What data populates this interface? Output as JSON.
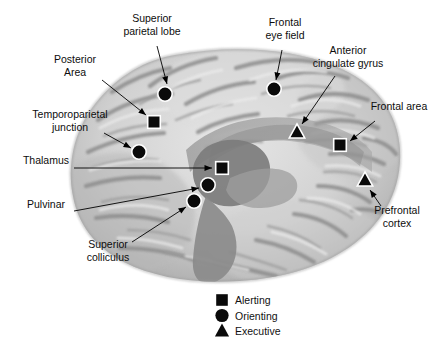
{
  "figure": {
    "background_color": "#ffffff",
    "marker_color": "#0a0a0a",
    "marker_outline_color": "#ffffff",
    "brain_fill_light": "#d9d9d9",
    "brain_fill_mid": "#b4b4b4",
    "brain_fill_dark": "#8e8e8e",
    "overlay_band_color": "#9a9a9a",
    "overlay_core_color": "#7b7b7b"
  },
  "callouts": [
    {
      "id": "superior-parietal-lobe",
      "lines": [
        "Superior",
        "parietal lobe"
      ],
      "marker": "circle",
      "network": "Orienting",
      "label_x": 152,
      "label_y": 22,
      "marker_x": 165,
      "marker_y": 94,
      "leader": "M157,46 L167,84"
    },
    {
      "id": "posterior-area",
      "lines": [
        "Posterior",
        "Area"
      ],
      "marker": "square",
      "network": "Alerting",
      "label_x": 75,
      "label_y": 63,
      "marker_x": 154,
      "marker_y": 122,
      "leader": "M102,80 L146,115"
    },
    {
      "id": "temporoparietal-junction",
      "lines": [
        "Temporoparietal",
        "junction"
      ],
      "marker": "circle",
      "network": "Orienting",
      "label_x": 70,
      "label_y": 118,
      "marker_x": 139,
      "marker_y": 152,
      "leader": "M104,133 L131,148"
    },
    {
      "id": "thalamus",
      "lines": [
        "Thalamus"
      ],
      "marker": "square",
      "network": "Alerting",
      "label_x": 46,
      "label_y": 164,
      "marker_x": 222,
      "marker_y": 168,
      "leader": "M74,168 L212,168"
    },
    {
      "id": "pulvinar",
      "lines": [
        "Pulvinar"
      ],
      "marker": "circle",
      "network": "Orienting",
      "label_x": 46,
      "label_y": 208,
      "marker_x": 208,
      "marker_y": 185,
      "leader": "M74,211 L199,188"
    },
    {
      "id": "superior-colliculus",
      "lines": [
        "Superior",
        "colliculus"
      ],
      "marker": "circle",
      "network": "Orienting",
      "label_x": 108,
      "label_y": 248,
      "marker_x": 194,
      "marker_y": 201,
      "leader": "M132,242 L186,207"
    },
    {
      "id": "frontal-eye-field",
      "lines": [
        "Frontal",
        "eye field"
      ],
      "marker": "circle",
      "network": "Orienting",
      "label_x": 285,
      "label_y": 26,
      "marker_x": 274,
      "marker_y": 89,
      "leader": "M282,50 L276,80"
    },
    {
      "id": "anterior-cingulate-gyrus",
      "lines": [
        "Anterior",
        "cingulate gyrus"
      ],
      "marker": "triangle",
      "network": "Executive",
      "label_x": 348,
      "label_y": 54,
      "marker_x": 297,
      "marker_y": 132,
      "leader": "M335,76 L302,124"
    },
    {
      "id": "frontal-area",
      "lines": [
        "Frontal area"
      ],
      "marker": "square",
      "network": "Alerting",
      "label_x": 399,
      "label_y": 110,
      "marker_x": 340,
      "marker_y": 145,
      "leader": "M375,121 L350,141"
    },
    {
      "id": "prefrontal-cortex",
      "lines": [
        "Prefrontal",
        "cortex"
      ],
      "marker": "triangle",
      "network": "Executive",
      "label_x": 397,
      "label_y": 214,
      "marker_x": 365,
      "marker_y": 180,
      "leader": "M381,206 L370,190"
    }
  ],
  "legend": {
    "x": 222,
    "y": 300,
    "items": [
      {
        "shape": "square",
        "label": "Alerting"
      },
      {
        "shape": "circle",
        "label": "Orienting"
      },
      {
        "shape": "triangle",
        "label": "Executive"
      }
    ]
  }
}
